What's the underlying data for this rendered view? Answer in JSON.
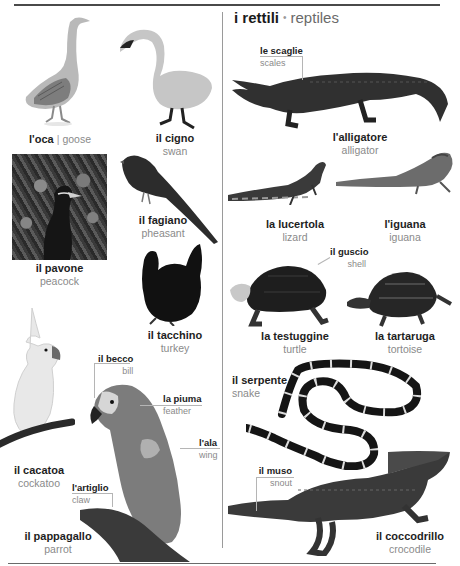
{
  "header": {
    "section_title_it": "i rettili",
    "section_title_sep": "•",
    "section_title_en": "reptiles"
  },
  "birds": {
    "goose": {
      "it": "l'oca",
      "sep": "|",
      "en": "goose"
    },
    "swan": {
      "it": "il cigno",
      "en": "swan"
    },
    "peacock": {
      "it": "il pavone",
      "en": "peacock"
    },
    "pheasant": {
      "it": "il fagiano",
      "en": "pheasant"
    },
    "turkey": {
      "it": "il tacchino",
      "en": "turkey"
    },
    "cockatoo": {
      "it": "il cacatoa",
      "en": "cockatoo"
    },
    "parrot": {
      "it": "il pappagallo",
      "en": "parrot"
    }
  },
  "parrot_callouts": {
    "bill": {
      "it": "il becco",
      "en": "bill"
    },
    "feather": {
      "it": "la piuma",
      "en": "feather"
    },
    "wing": {
      "it": "l'ala",
      "en": "wing"
    },
    "claw": {
      "it": "l'artiglio",
      "en": "claw"
    }
  },
  "reptiles": {
    "alligator": {
      "it": "l'alligatore",
      "en": "alligator"
    },
    "lizard": {
      "it": "la lucertola",
      "en": "lizard"
    },
    "iguana": {
      "it": "l'iguana",
      "en": "iguana"
    },
    "turtle": {
      "it": "la testuggine",
      "en": "turtle"
    },
    "tortoise": {
      "it": "la tartaruga",
      "en": "tortoise"
    },
    "snake": {
      "it": "il serpente",
      "en": "snake"
    },
    "crocodile": {
      "it": "il coccodrillo",
      "en": "crocodile"
    }
  },
  "reptile_callouts": {
    "scales": {
      "it": "le scaglie",
      "en": "scales"
    },
    "shell": {
      "it": "il guscio",
      "en": "shell"
    },
    "snout": {
      "it": "il muso",
      "en": "snout"
    }
  }
}
